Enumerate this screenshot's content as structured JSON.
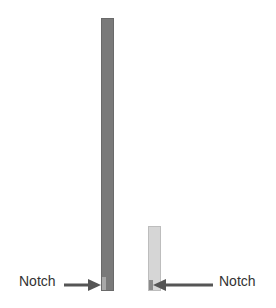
{
  "diagram": {
    "bars": [
      {
        "name": "tall-bar",
        "color": "#7a7a7a",
        "notch_color": "#a8a8a8"
      },
      {
        "name": "short-bar",
        "color": "#d6d6d6",
        "notch_color": "#8a8a8a"
      }
    ],
    "labels": {
      "left": "Notch",
      "right": "Notch"
    },
    "arrow_color": "#555555"
  }
}
